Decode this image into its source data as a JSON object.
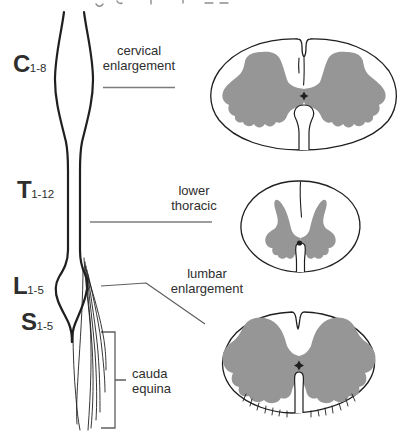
{
  "colors": {
    "gray_matter": "#969696",
    "outline": "#1f1f1f",
    "leader_line": "#7c7c7c",
    "bracket_line": "#5f5f5f",
    "text": "#2e2e2e"
  },
  "segments": [
    {
      "id": "cervical",
      "letter": "C",
      "range": "1-8"
    },
    {
      "id": "thoracic",
      "letter": "T",
      "range": "1-12"
    },
    {
      "id": "lumbar",
      "letter": "L",
      "range": "1-5"
    },
    {
      "id": "sacral",
      "letter": "S",
      "range": "1-5"
    }
  ],
  "annotations": {
    "cervical_enlargement": {
      "line1": "cervical",
      "line2": "enlargement"
    },
    "lower_thoracic": {
      "line1": "lower",
      "line2": "thoracic"
    },
    "lumbar_enlargement": {
      "line1": "lumbar",
      "line2": "enlargement"
    },
    "cauda_equina": {
      "line1": "cauda",
      "line2": "equina"
    }
  },
  "cross_sections": [
    {
      "id": "cervical-section",
      "level": "cervical enlargement"
    },
    {
      "id": "thoracic-section",
      "level": "lower thoracic"
    },
    {
      "id": "lumbar-section",
      "level": "lumbar enlargement"
    }
  ]
}
